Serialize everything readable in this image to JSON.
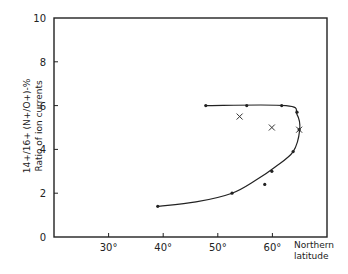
{
  "chart_data": {
    "type": "line",
    "title": "",
    "xlabel": "Northern latitude",
    "ylabel": "Ratio of ion currents 14+/16+ (N+/O+) - %",
    "ylabel_line1": "Ratio of ion currents",
    "ylabel_line2": "14+/16+ (N+/O+)-%",
    "xlim": [
      20,
      70
    ],
    "ylim": [
      0,
      10
    ],
    "x_ticks": [
      30,
      40,
      50,
      60
    ],
    "x_tick_labels": [
      "30°",
      "40°",
      "50°",
      "60°"
    ],
    "y_ticks": [
      0,
      2,
      4,
      6,
      8,
      10
    ],
    "y_tick_labels": [
      "0",
      "2",
      "4",
      "6",
      "8",
      "10"
    ],
    "grid": false,
    "legend": null,
    "series": [
      {
        "name": "measured (dots)",
        "marker": "dot",
        "points": [
          {
            "x": 39.0,
            "y": 1.4
          },
          {
            "x": 52.6,
            "y": 2.0
          },
          {
            "x": 58.6,
            "y": 2.4
          },
          {
            "x": 59.9,
            "y": 3.0
          },
          {
            "x": 63.8,
            "y": 3.9
          },
          {
            "x": 64.9,
            "y": 4.9
          },
          {
            "x": 64.5,
            "y": 5.7
          },
          {
            "x": 61.7,
            "y": 6.0
          },
          {
            "x": 55.3,
            "y": 6.0
          },
          {
            "x": 47.8,
            "y": 6.0
          }
        ]
      },
      {
        "name": "crosses",
        "marker": "x",
        "points": [
          {
            "x": 54.0,
            "y": 5.5
          },
          {
            "x": 59.9,
            "y": 5.0
          },
          {
            "x": 64.9,
            "y": 4.9
          }
        ]
      },
      {
        "name": "fitted curve",
        "marker": "none",
        "points": [
          {
            "x": 39.0,
            "y": 1.4
          },
          {
            "x": 46.0,
            "y": 1.6
          },
          {
            "x": 52.6,
            "y": 2.0
          },
          {
            "x": 57.0,
            "y": 2.6
          },
          {
            "x": 60.5,
            "y": 3.2
          },
          {
            "x": 63.8,
            "y": 3.9
          },
          {
            "x": 65.0,
            "y": 4.9
          },
          {
            "x": 64.5,
            "y": 5.6
          },
          {
            "x": 62.5,
            "y": 6.0
          },
          {
            "x": 47.8,
            "y": 6.0
          }
        ]
      }
    ]
  }
}
